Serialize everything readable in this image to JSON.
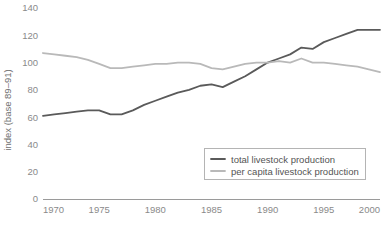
{
  "chart_data": {
    "type": "line",
    "title": "",
    "xlabel": "",
    "ylabel": "index (base 89–91)",
    "xlim": [
      1970,
      2000
    ],
    "ylim": [
      0,
      140
    ],
    "grid": false,
    "legend_position": "bottom-right",
    "x": [
      1970,
      1971,
      1972,
      1973,
      1974,
      1975,
      1976,
      1977,
      1978,
      1979,
      1980,
      1981,
      1982,
      1983,
      1984,
      1985,
      1986,
      1987,
      1988,
      1989,
      1990,
      1991,
      1992,
      1993,
      1994,
      1995,
      1996,
      1997,
      1998,
      1999,
      2000
    ],
    "xticks": [
      1970,
      1975,
      1980,
      1985,
      1990,
      1995,
      2000
    ],
    "xtick_labels": [
      "1970",
      "1975",
      "1980",
      "1985",
      "1990",
      "1995",
      "2000"
    ],
    "yticks": [
      0,
      20,
      40,
      60,
      80,
      100,
      120,
      140
    ],
    "ytick_labels": [
      "0",
      "20",
      "40",
      "60",
      "80",
      "100",
      "120",
      "140"
    ],
    "series": [
      {
        "name": "total livestock production",
        "color": "#5a5a5a",
        "width": 1.8,
        "values": [
          61,
          62,
          63,
          64,
          65,
          65,
          62,
          62,
          65,
          69,
          72,
          75,
          78,
          80,
          83,
          84,
          82,
          86,
          90,
          95,
          100,
          103,
          106,
          111,
          110,
          115,
          118,
          121,
          124,
          124,
          124
        ]
      },
      {
        "name": "per capita livestock production",
        "color": "#b9b9b9",
        "width": 1.8,
        "values": [
          107,
          106,
          105,
          104,
          102,
          99,
          96,
          96,
          97,
          98,
          99,
          99,
          100,
          100,
          99,
          96,
          95,
          97,
          99,
          100,
          100,
          101,
          100,
          103,
          100,
          100,
          99,
          98,
          97,
          95,
          93
        ]
      }
    ]
  },
  "legend": {
    "items": [
      {
        "label": "total livestock production",
        "color": "#5a5a5a"
      },
      {
        "label": "per capita livestock production",
        "color": "#b9b9b9"
      }
    ]
  },
  "axes": {
    "y_axis_title": "index (base 89–91)"
  },
  "colors": {
    "background": "#ffffff",
    "axis": "#9a9a9a",
    "tick_text": "#8a8a8a",
    "legend_border": "#b4b4b4",
    "series_total": "#5a5a5a",
    "series_per_capita": "#b9b9b9"
  }
}
